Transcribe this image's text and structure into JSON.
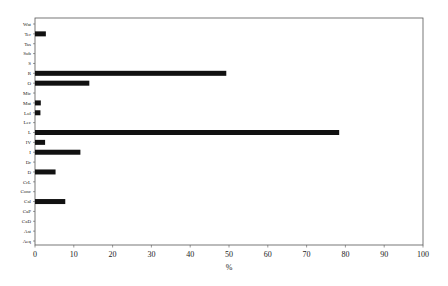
{
  "chart_data": {
    "type": "bar",
    "orientation": "horizontal",
    "title": "",
    "xlabel": "%",
    "ylabel": "",
    "xlim": [
      0,
      100
    ],
    "xticks": [
      0,
      10,
      20,
      30,
      40,
      50,
      60,
      70,
      80,
      90,
      100
    ],
    "grid": false,
    "legend": null,
    "bar_color": "#111111",
    "categories": [
      "Wat",
      "Ter",
      "Tas",
      "Sub",
      "S",
      "R",
      "O",
      "Mic",
      "Mat",
      "Lol",
      "Lec",
      "L",
      "IV",
      "I",
      "Dr",
      "D",
      "CrL",
      "Conc",
      "Cal",
      "CaP",
      "CaD",
      "Ast",
      "Aeq"
    ],
    "values": [
      0,
      2.8,
      0,
      0,
      0,
      49.3,
      14.0,
      0,
      1.5,
      1.4,
      0,
      78.4,
      2.6,
      11.7,
      0,
      5.3,
      0,
      0,
      7.8,
      0,
      0,
      0,
      0
    ]
  }
}
